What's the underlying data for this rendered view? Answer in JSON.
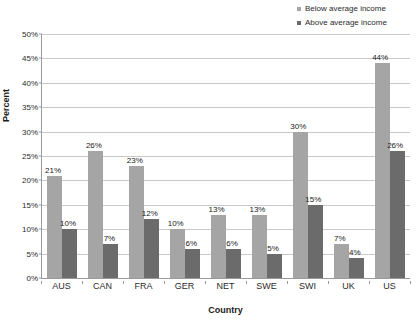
{
  "chart_data": {
    "type": "bar",
    "title": "",
    "xlabel": "Country",
    "ylabel": "Percent",
    "ylim": [
      0,
      50
    ],
    "ytick_step": 5,
    "ytick_labels": [
      "0%",
      "5%",
      "10%",
      "15%",
      "20%",
      "25%",
      "30%",
      "35%",
      "40%",
      "45%",
      "50%"
    ],
    "grid": true,
    "legend_position": "top-right",
    "categories": [
      "AUS",
      "CAN",
      "FRA",
      "GER",
      "NET",
      "SWE",
      "SWI",
      "UK",
      "US"
    ],
    "series": [
      {
        "name": "Below average income",
        "color": "#a5a5a5",
        "values": [
          21,
          26,
          23,
          10,
          13,
          13,
          30,
          7,
          44
        ],
        "labels": [
          "21%",
          "26%",
          "23%",
          "10%",
          "13%",
          "13%",
          "30%",
          "7%",
          "44%"
        ]
      },
      {
        "name": "Above average income",
        "color": "#6b6b6b",
        "values": [
          10,
          7,
          12,
          6,
          6,
          5,
          15,
          4,
          26
        ],
        "labels": [
          "10%",
          "7%",
          "12%",
          "6%",
          "6%",
          "5%",
          "15%",
          "4%",
          "26%"
        ]
      }
    ]
  },
  "colors": {
    "below_average": "#a5a5a5",
    "above_average": "#6b6b6b",
    "gridline": "#c9c9c9",
    "axis": "#9a9a9a",
    "text": "#1a1a1a"
  }
}
